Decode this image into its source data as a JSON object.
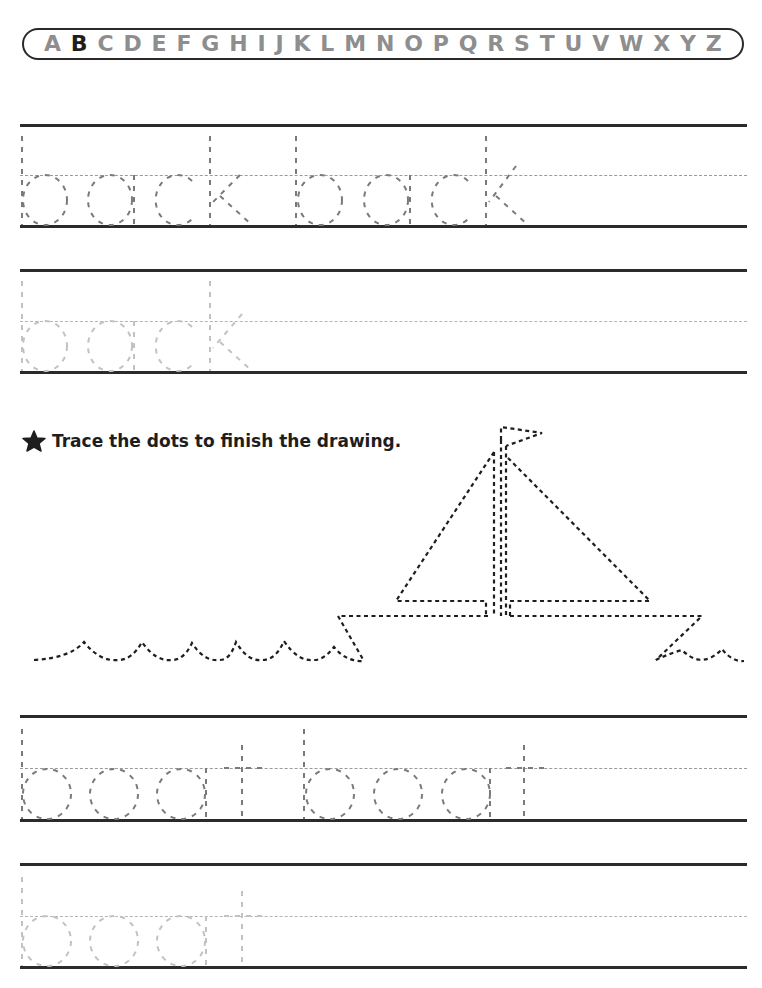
{
  "alphabet": {
    "letters": [
      "A",
      "B",
      "C",
      "D",
      "E",
      "F",
      "G",
      "H",
      "I",
      "J",
      "K",
      "L",
      "M",
      "N",
      "O",
      "P",
      "Q",
      "R",
      "S",
      "T",
      "U",
      "V",
      "W",
      "X",
      "Y",
      "Z"
    ],
    "highlighted": "B"
  },
  "practice_rows": [
    {
      "word": "back",
      "repeats": 2,
      "shade": "dark"
    },
    {
      "word": "back",
      "repeats": 1,
      "shade": "light"
    },
    {
      "word": "boat",
      "repeats": 2,
      "shade": "dark"
    },
    {
      "word": "boat",
      "repeats": 1,
      "shade": "light"
    }
  ],
  "instruction": {
    "icon": "star-icon",
    "text": "Trace the dots to finish the drawing."
  },
  "drawing": {
    "subject": "sailboat on waves",
    "style": "dotted tracing lines"
  },
  "colors": {
    "line": "#2b2b2b",
    "trace_dark": "#7a7a7a",
    "trace_light": "#bdbdbd",
    "letter_gray": "#8e8e8e",
    "letter_highlight": "#1e1e1e"
  }
}
